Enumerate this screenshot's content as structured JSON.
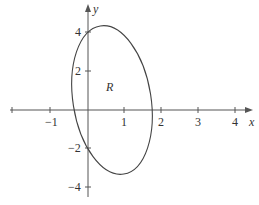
{
  "figure": {
    "region_label": "R",
    "x_axis": {
      "label": "x",
      "ticks": [
        {
          "value": "−1",
          "px": 50
        },
        {
          "value": "1",
          "px": 124
        },
        {
          "value": "2",
          "px": 161
        },
        {
          "value": "3",
          "px": 198
        },
        {
          "value": "4",
          "px": 235
        }
      ]
    },
    "y_axis": {
      "label": "y",
      "ticks": [
        {
          "value": "4",
          "py": 32
        },
        {
          "value": "2",
          "py": 71
        },
        {
          "value": "−2",
          "py": 148
        },
        {
          "value": "−4",
          "py": 187
        }
      ]
    },
    "curve": {
      "type": "ellipse",
      "description": "closed tilted ellipse bounding region R",
      "approx_extent": {
        "x_min": -0.45,
        "x_max": 1.75,
        "y_min": -3.3,
        "y_max": 4.3
      },
      "stroke_color": "#444444"
    }
  }
}
